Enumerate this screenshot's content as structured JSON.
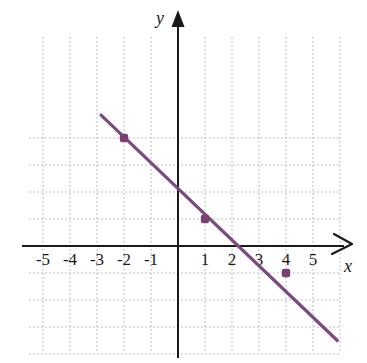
{
  "figure": {
    "kind": "coordinate-plane-line-graph",
    "background_color": "#ffffff",
    "grid_color": "#c9c9d4",
    "axis_color": "#1a1a1a",
    "line_color": "#7b4a7e",
    "point_color": "#7b3f72"
  },
  "axes": {
    "x_label": "x",
    "y_label": "y",
    "x_ticks": [
      "-5",
      "-4",
      "-3",
      "-2",
      "-1",
      "1",
      "2",
      "3",
      "4",
      "5"
    ],
    "x_tick_values": [
      -5,
      -4,
      -3,
      -2,
      -1,
      1,
      2,
      3,
      4,
      5
    ],
    "y_ticks": [],
    "xlim": [
      -5.5,
      6.0
    ],
    "ylim": [
      -4.0,
      4.5
    ],
    "grid": true,
    "grid_style": "dotted",
    "x_arrow": true,
    "y_arrow": true
  },
  "chart_data": {
    "type": "line",
    "title": "",
    "xlabel": "x",
    "ylabel": "y",
    "xlim": [
      -5.5,
      6.0
    ],
    "ylim": [
      -4.0,
      4.5
    ],
    "grid": true,
    "legend": "none",
    "series": [
      {
        "name": "line",
        "color": "#7b4a7e",
        "slope": -1,
        "y_intercept": 2,
        "equation": "y = -x + 2",
        "x": [
          -2.85,
          5.9
        ],
        "y": [
          4.85,
          -3.5
        ],
        "points": [
          {
            "x": -2,
            "y": 4,
            "label": "(-2, 4)"
          },
          {
            "x": 1,
            "y": 1,
            "label": "(1, 1)"
          },
          {
            "x": 4,
            "y": -1,
            "label": "(4, -1)"
          }
        ]
      }
    ],
    "marked_points": [
      {
        "x": -2,
        "y": 4
      },
      {
        "x": 1,
        "y": 1
      },
      {
        "x": 4,
        "y": -1
      }
    ]
  }
}
